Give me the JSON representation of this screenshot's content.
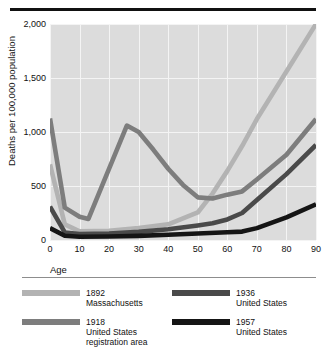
{
  "figure": {
    "top_rule_color": "#111111",
    "panel_bg": "#dcdcdc",
    "grid_color": "#f4f4f4"
  },
  "axes": {
    "x_title": "Age",
    "y_title": "Deaths per 100,000 population",
    "x_ticks": [
      "0",
      "10",
      "20",
      "30",
      "40",
      "50",
      "60",
      "70",
      "80",
      "90"
    ],
    "y_ticks": [
      "0",
      "500",
      "1,000",
      "1,500",
      "2,000"
    ]
  },
  "legend": {
    "items": [
      {
        "year": "1892",
        "place": "Massachusetts",
        "place2": "",
        "color": "#b3b3b3"
      },
      {
        "year": "1936",
        "place": "United States",
        "place2": "",
        "color": "#4a4a4a"
      },
      {
        "year": "1918",
        "place": "United States",
        "place2": "registration area",
        "color": "#7d7d7d"
      },
      {
        "year": "1957",
        "place": "United States",
        "place2": "",
        "color": "#151515"
      }
    ]
  },
  "chart_data": {
    "type": "line",
    "title": "",
    "xlabel": "Age",
    "ylabel": "Deaths per 100,000 population",
    "xlim": [
      0,
      90
    ],
    "ylim": [
      0,
      2000
    ],
    "xticks": [
      0,
      10,
      20,
      30,
      40,
      50,
      60,
      70,
      80,
      90
    ],
    "yticks": [
      0,
      500,
      1000,
      1500,
      2000
    ],
    "grid": true,
    "legend_position": "below",
    "series": [
      {
        "name": "1892 Massachusetts",
        "color": "#b3b3b3",
        "x": [
          0,
          5,
          10,
          20,
          30,
          40,
          50,
          55,
          60,
          65,
          70,
          80,
          90
        ],
        "y": [
          700,
          145,
          80,
          85,
          110,
          145,
          255,
          430,
          640,
          870,
          1120,
          1560,
          2000
        ]
      },
      {
        "name": "1918 United States registration area",
        "color": "#7d7d7d",
        "x": [
          0,
          5,
          10,
          13,
          20,
          26,
          30,
          35,
          40,
          45,
          50,
          55,
          60,
          65,
          70,
          80,
          90
        ],
        "y": [
          1125,
          300,
          215,
          195,
          660,
          1060,
          1000,
          835,
          660,
          510,
          395,
          385,
          420,
          450,
          560,
          790,
          1120
        ]
      },
      {
        "name": "1936 United States",
        "color": "#4a4a4a",
        "x": [
          0,
          5,
          10,
          20,
          30,
          40,
          50,
          55,
          60,
          65,
          70,
          80,
          90
        ],
        "y": [
          310,
          70,
          55,
          60,
          75,
          100,
          135,
          155,
          190,
          250,
          370,
          610,
          880
        ]
      },
      {
        "name": "1957 United States",
        "color": "#151515",
        "x": [
          0,
          5,
          10,
          20,
          30,
          40,
          50,
          60,
          65,
          70,
          80,
          90
        ],
        "y": [
          110,
          40,
          30,
          32,
          38,
          48,
          60,
          72,
          78,
          110,
          210,
          330
        ]
      }
    ]
  }
}
